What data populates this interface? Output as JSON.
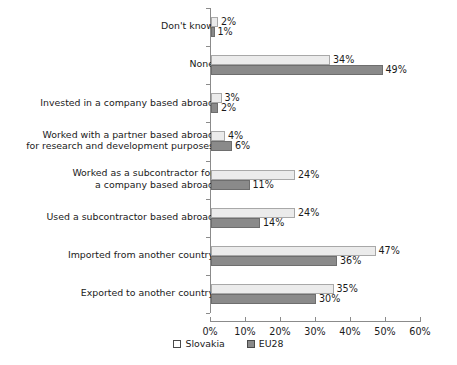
{
  "chart_data": {
    "type": "bar",
    "orientation": "horizontal",
    "title": "",
    "xlabel": "",
    "ylabel": "",
    "xlim": [
      0,
      60
    ],
    "xticks": [
      "0%",
      "10%",
      "20%",
      "30%",
      "40%",
      "50%",
      "60%"
    ],
    "xtick_values": [
      0,
      10,
      20,
      30,
      40,
      50,
      60
    ],
    "grid": false,
    "legend_position": "bottom",
    "categories": [
      "Don't know",
      "None",
      "Invested in a company based abroad",
      "Worked with a partner based abroad\nfor research and development purposes",
      "Worked as a subcontractor for\na company based abroad",
      "Used a subcontractor based abroad",
      "Imported from another country",
      "Exported to another country"
    ],
    "series": [
      {
        "name": "Slovakia",
        "color": "#ebebeb",
        "values": [
          2,
          34,
          3,
          4,
          24,
          24,
          47,
          35
        ],
        "labels": [
          "2%",
          "34%",
          "3%",
          "4%",
          "24%",
          "24%",
          "47%",
          "35%"
        ]
      },
      {
        "name": "EU28",
        "color": "#8a8a8a",
        "values": [
          1,
          49,
          2,
          6,
          11,
          14,
          36,
          30
        ],
        "labels": [
          "1%",
          "49%",
          "2%",
          "6%",
          "11%",
          "14%",
          "36%",
          "30%"
        ]
      }
    ]
  },
  "legend": {
    "items": [
      {
        "label": "Slovakia"
      },
      {
        "label": "EU28"
      }
    ]
  }
}
